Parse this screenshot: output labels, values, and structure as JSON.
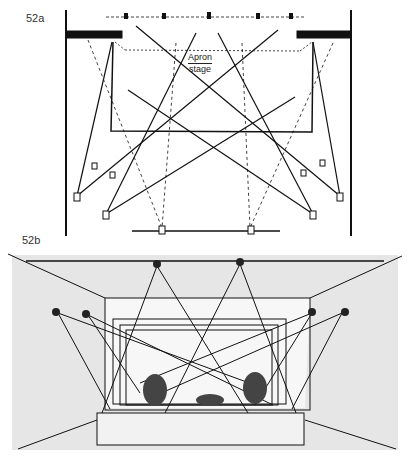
{
  "figures": [
    {
      "id": "52a",
      "label": "52a",
      "type": "plan-view",
      "annotation": {
        "line1": "Apron",
        "line2": "stage"
      }
    },
    {
      "id": "52b",
      "label": "52b",
      "type": "perspective-view"
    }
  ],
  "colors": {
    "ink": "#111111",
    "paper": "#ffffff",
    "wall_shade": "#d8d8d8"
  }
}
